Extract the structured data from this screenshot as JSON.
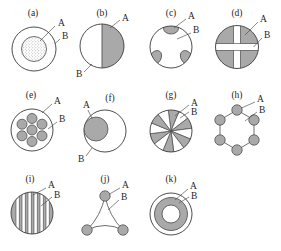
{
  "figure": {
    "title": "",
    "background_color": "#ffffff",
    "gray_fill": "#a9a9a9",
    "white_fill": "#ffffff",
    "stroke_color": "#3a3a3a",
    "label_a": "A",
    "label_b": "B",
    "panels": [
      {
        "id": "a",
        "caption": "(a)",
        "description": "outer circle with stippled inner circle",
        "label_a": "A",
        "label_b": "B"
      },
      {
        "id": "b",
        "caption": "(b)",
        "description": "circle split into shaded right half and white left half",
        "label_a": "A",
        "label_b": "B"
      },
      {
        "id": "c",
        "caption": "(c)",
        "description": "circle with three shaded lens shapes on the perimeter",
        "label_a": "A",
        "label_b": "B"
      },
      {
        "id": "d",
        "caption": "(d)",
        "description": "shaded circle divided by a white cross into four quadrants",
        "label_a": "A",
        "label_b": "B"
      },
      {
        "id": "e",
        "caption": "(e)",
        "description": "circle containing seven small shaded circles",
        "label_a": "A",
        "label_b": "B"
      },
      {
        "id": "f",
        "caption": "(f)",
        "description": "large circle with offset shaded circle tangent to the left edge",
        "label_a": "A",
        "label_b": "B"
      },
      {
        "id": "g",
        "caption": "(g)",
        "description": "circle of alternating shaded and white radial wedges",
        "label_a": "A",
        "label_b": "B"
      },
      {
        "id": "h",
        "caption": "(h)",
        "description": "hexagonal ring of six shaded circles joined by lines",
        "label_a": "A",
        "label_b": "B"
      },
      {
        "id": "i",
        "caption": "(i)",
        "description": "shaded circle with vertical white lamellar stripes",
        "label_a": "A",
        "label_b": "B"
      },
      {
        "id": "j",
        "caption": "(j)",
        "description": "three shaded circles at triangle vertices joined by concave curves",
        "label_a": "A",
        "label_b": "B"
      },
      {
        "id": "k",
        "caption": "(k)",
        "description": "concentric circles with a shaded annulus and white core",
        "label_a": "A",
        "label_b": "B"
      }
    ]
  }
}
